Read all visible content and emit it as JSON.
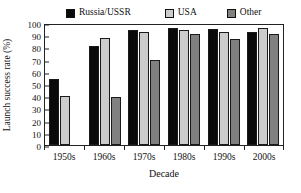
{
  "chart_data": {
    "type": "bar",
    "title": "",
    "xlabel": "Decade",
    "ylabel": "Launch success rate (%)",
    "categories": [
      "1950s",
      "1960s",
      "1970s",
      "1980s",
      "1990s",
      "2000s"
    ],
    "series": [
      {
        "name": "Russia/USSR",
        "color": "#0a0a0a",
        "values": [
          54,
          81,
          94,
          96,
          95,
          93
        ]
      },
      {
        "name": "USA",
        "color": "#cccccc",
        "values": [
          40,
          88,
          93,
          94,
          93,
          96
        ]
      },
      {
        "name": "Other",
        "color": "#808080",
        "values": [
          null,
          39,
          70,
          91,
          87,
          91
        ]
      }
    ],
    "ylim": [
      0,
      100
    ],
    "yticks": [
      0,
      10,
      20,
      30,
      40,
      50,
      60,
      70,
      80,
      90,
      100
    ],
    "grid": false,
    "legend_position": "top"
  },
  "legend": {
    "items": [
      {
        "label": "Russia/USSR",
        "color": "#0a0a0a"
      },
      {
        "label": "USA",
        "color": "#cccccc"
      },
      {
        "label": "Other",
        "color": "#808080"
      }
    ]
  },
  "axes": {
    "y_label": "Launch success rate (%)",
    "x_label": "Decade",
    "y_ticks": [
      "0",
      "10",
      "20",
      "30",
      "40",
      "50",
      "60",
      "70",
      "80",
      "90",
      "100"
    ],
    "x_ticks": [
      "1950s",
      "1960s",
      "1970s",
      "1980s",
      "1990s",
      "2000s"
    ]
  }
}
